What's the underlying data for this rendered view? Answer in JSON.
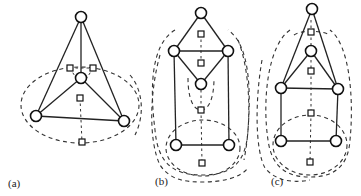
{
  "figure": {
    "panels": [
      {
        "label": "(a)",
        "label_pos": [
          8,
          187
        ],
        "nodes": [
          [
            81,
            17
          ],
          [
            81,
            78
          ],
          [
            36,
            116
          ],
          [
            124,
            121
          ]
        ],
        "edges": [
          [
            0,
            1
          ],
          [
            0,
            2
          ],
          [
            0,
            3
          ],
          [
            1,
            2
          ],
          [
            1,
            3
          ],
          [
            2,
            3
          ]
        ],
        "dual_vertices": [
          [
            70,
            68
          ],
          [
            93,
            68
          ],
          [
            80,
            98
          ],
          [
            82,
            142
          ]
        ],
        "dual_loops": [
          {
            "type": "ellipse",
            "cx": 80,
            "cy": 105,
            "rx": 59,
            "ry": 38
          }
        ],
        "dual_edges": [
          {
            "d": "M70,68 L93,68"
          },
          {
            "d": "M80,98 L82,142"
          },
          {
            "d": "M70,68 L76,78"
          },
          {
            "d": "M93,68 L87,78"
          }
        ]
      },
      {
        "label": "(b)",
        "label_pos": [
          155,
          185
        ],
        "nodes": [
          [
            201,
            13
          ],
          [
            174,
            51
          ],
          [
            228,
            51
          ],
          [
            201,
            84
          ],
          [
            176,
            145
          ],
          [
            229,
            145
          ]
        ],
        "edges": [
          [
            0,
            1
          ],
          [
            0,
            2
          ],
          [
            1,
            2
          ],
          [
            1,
            3
          ],
          [
            2,
            3
          ],
          [
            1,
            4
          ],
          [
            2,
            5
          ],
          [
            4,
            5
          ]
        ],
        "dual_vertices": [
          [
            201,
            34
          ],
          [
            201,
            63
          ],
          [
            201,
            110
          ],
          [
            202,
            163
          ]
        ],
        "dual_loops": [
          {
            "type": "path",
            "d": "M175,30 C150,45 150,90 155,130 C158,165 175,175 202,175 C230,175 246,165 248,130 C251,90 250,45 228,30"
          },
          {
            "type": "path",
            "d": "M160,55 C150,90 148,140 160,165 C170,180 185,182 202,182 C222,182 240,178 248,168"
          },
          {
            "type": "ellipse",
            "cx": 203,
            "cy": 148,
            "rx": 37,
            "ry": 28
          },
          {
            "type": "path",
            "d": "M188,78 C188,100 194,110 201,110 C208,110 214,100 214,78"
          }
        ],
        "dual_edges": [
          {
            "d": "M201,34 L201,63"
          },
          {
            "d": "M201,90 L201,110"
          },
          {
            "d": "M201,110 L202,163"
          }
        ]
      },
      {
        "label": "(c)",
        "label_pos": [
          271,
          185
        ],
        "nodes": [
          [
            312,
            9
          ],
          [
            311,
            51
          ],
          [
            281,
            88
          ],
          [
            338,
            89
          ],
          [
            281,
            141
          ],
          [
            336,
            141
          ]
        ],
        "edges": [
          [
            0,
            2
          ],
          [
            0,
            3
          ],
          [
            1,
            2
          ],
          [
            1,
            3
          ],
          [
            2,
            3
          ],
          [
            2,
            4
          ],
          [
            3,
            5
          ],
          [
            4,
            5
          ]
        ],
        "dual_vertices": [
          [
            311,
            32
          ],
          [
            311,
            71
          ],
          [
            311,
            113
          ],
          [
            310,
            162
          ]
        ],
        "dual_loops": [
          {
            "type": "path",
            "d": "M290,30 C268,45 262,100 268,140 C272,170 290,177 310,177 C330,177 348,170 350,140 C354,100 350,45 330,30"
          },
          {
            "type": "path",
            "d": "M262,60 C255,100 255,150 265,168 C278,184 300,182 310,180"
          },
          {
            "type": "ellipse",
            "cx": 310,
            "cy": 145,
            "rx": 37,
            "ry": 30
          },
          {
            "type": "path",
            "d": "M294,35 C300,30 322,30 330,35"
          }
        ],
        "dual_edges": [
          {
            "d": "M311,20 L311,32"
          },
          {
            "d": "M311,32 L311,45"
          },
          {
            "d": "M311,60 L311,71"
          },
          {
            "d": "M311,71 L311,113"
          },
          {
            "d": "M311,113 L310,162"
          }
        ]
      }
    ],
    "context_arcs": [
      {
        "d": "M130,75 C143,90 145,115 135,135"
      },
      {
        "d": "M238,40 C250,70 252,120 244,160"
      }
    ]
  }
}
